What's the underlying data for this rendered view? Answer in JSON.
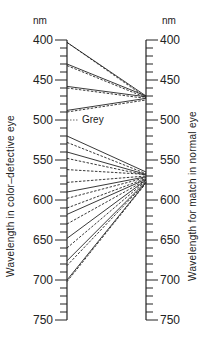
{
  "left_axis": {
    "unit": "nm",
    "title": "Wavelength in color–defective eye",
    "ticks": [
      "400",
      "450",
      "500",
      "550",
      "600",
      "650",
      "700",
      "750"
    ]
  },
  "right_axis": {
    "unit": "nm",
    "title": "Wavelength for match in normal eye",
    "ticks": [
      "400",
      "450",
      "500",
      "550",
      "600",
      "650",
      "700",
      "750"
    ]
  },
  "grey_label": "Grey",
  "scale": {
    "min": 400,
    "max": 750,
    "y_at_min": 40,
    "px_per_nm": 0.8
  },
  "lines": [
    {
      "from": 403,
      "to": 470,
      "style": "solid"
    },
    {
      "from": 403,
      "to": 472,
      "style": "dashed"
    },
    {
      "from": 430,
      "to": 470,
      "style": "solid"
    },
    {
      "from": 432,
      "to": 472,
      "style": "dashed"
    },
    {
      "from": 458,
      "to": 471,
      "style": "solid"
    },
    {
      "from": 460,
      "to": 473,
      "style": "dashed"
    },
    {
      "from": 488,
      "to": 473,
      "style": "solid"
    },
    {
      "from": 490,
      "to": 475,
      "style": "dashed"
    },
    {
      "from": 500,
      "to": null,
      "style": "dotted-grey"
    },
    {
      "from": 520,
      "to": 565,
      "style": "solid"
    },
    {
      "from": 528,
      "to": 567,
      "style": "dashed"
    },
    {
      "from": 540,
      "to": 568,
      "style": "solid"
    },
    {
      "from": 548,
      "to": 569,
      "style": "dashed"
    },
    {
      "from": 562,
      "to": 568,
      "style": "dashed"
    },
    {
      "from": 578,
      "to": 570,
      "style": "dashed"
    },
    {
      "from": 590,
      "to": 571,
      "style": "solid"
    },
    {
      "from": 598,
      "to": 572,
      "style": "dashed"
    },
    {
      "from": 610,
      "to": 573,
      "style": "dashed"
    },
    {
      "from": 618,
      "to": 574,
      "style": "solid"
    },
    {
      "from": 630,
      "to": 575,
      "style": "dashed"
    },
    {
      "from": 648,
      "to": 575,
      "style": "solid"
    },
    {
      "from": 660,
      "to": 576,
      "style": "dashed"
    },
    {
      "from": 676,
      "to": 577,
      "style": "solid"
    },
    {
      "from": 682,
      "to": 578,
      "style": "dashed"
    },
    {
      "from": 700,
      "to": 578,
      "style": "solid"
    },
    {
      "from": 702,
      "to": 579,
      "style": "dashed"
    }
  ]
}
